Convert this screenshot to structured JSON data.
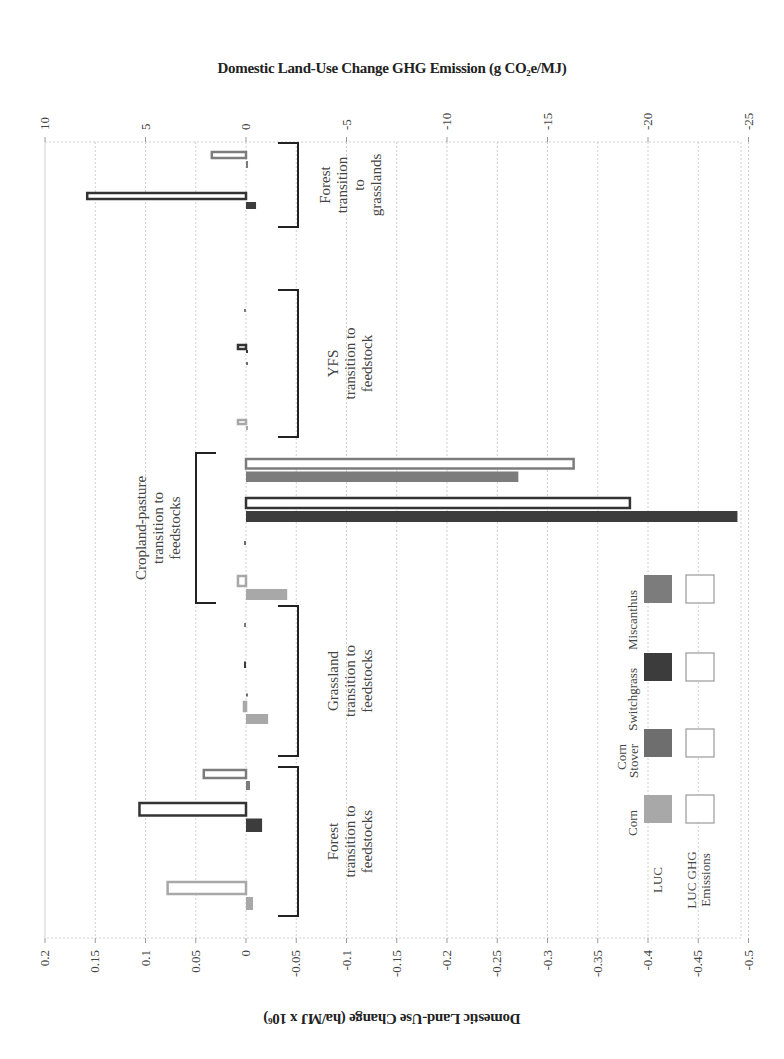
{
  "chart_data": {
    "type": "bar",
    "orientation": "horizontal-rotated",
    "title_top_axis": "Domestic Land-Use Change GHG  Emission (g CO2e/MJ)",
    "title_bottom_axis": "Domestic Land-Use Change (ha/MJ x 10^6)",
    "top_axis": {
      "label": "Domestic Land-Use Change GHG  Emission (g CO₂e/MJ)",
      "ticks": [
        10,
        5,
        0,
        -5,
        -10,
        -15,
        -20,
        -25
      ],
      "range": [
        10,
        -25
      ]
    },
    "bottom_axis": {
      "label": "Domestic Land-Use Change (ha/MJ x 10⁶)",
      "ticks": [
        0.2,
        0.15,
        0.1,
        0.05,
        0,
        -0.05,
        -0.1,
        -0.15,
        -0.2,
        -0.25,
        -0.3,
        -0.35,
        -0.4,
        -0.45,
        -0.5
      ],
      "range": [
        0.2,
        -0.5
      ]
    },
    "grid": true,
    "legend": {
      "position": "inside-bottom-right",
      "row_labels": [
        "LUC",
        "LUC GHG Emissions"
      ],
      "column_labels": [
        "Corn",
        "Corn Stover",
        "Switchgrass",
        "Miscanthus"
      ]
    },
    "colors": {
      "Corn": "#a8a8a8",
      "Corn Stover": "#6e6e6e",
      "Switchgrass": "#3c3c3c",
      "Miscanthus": "#7c7c7c"
    },
    "groups": [
      {
        "name": "Forest transition to grasslands",
        "label_lines": [
          "Forest",
          "transition",
          "to",
          "grasslands"
        ],
        "series": [
          {
            "feedstock": "Switchgrass",
            "luc": -0.01,
            "ghg": 7.9
          },
          {
            "feedstock": "Miscanthus",
            "luc": -0.002,
            "ghg": 1.7
          }
        ]
      },
      {
        "name": "YFS transition to feedstock",
        "label_lines": [
          "YFS",
          "transition to",
          "feedstock"
        ],
        "series": [
          {
            "feedstock": "Corn",
            "luc": 0.0,
            "ghg": 0.4
          },
          {
            "feedstock": "Corn Stover",
            "luc": 0.0,
            "ghg": 0.0
          },
          {
            "feedstock": "Switchgrass",
            "luc": 0.0,
            "ghg": 0.4
          },
          {
            "feedstock": "Miscanthus",
            "luc": 0.002,
            "ghg": 0.0
          }
        ]
      },
      {
        "name": "Cropland-pasture transition to feedstocks",
        "label_lines": [
          "Cropland-pasture",
          "transition to",
          "feedstocks"
        ],
        "series": [
          {
            "feedstock": "Corn",
            "luc": -0.041,
            "ghg": 0.4
          },
          {
            "feedstock": "Corn Stover",
            "luc": 0.002,
            "ghg": 0.0
          },
          {
            "feedstock": "Switchgrass",
            "luc": -0.489,
            "ghg": -19.1
          },
          {
            "feedstock": "Miscanthus",
            "luc": -0.271,
            "ghg": -16.3
          }
        ]
      },
      {
        "name": "Grassland transition to feedstocks",
        "label_lines": [
          "Grassland",
          "transition to",
          "feedstocks"
        ],
        "series": [
          {
            "feedstock": "Corn",
            "luc": -0.022,
            "ghg": 0.1
          },
          {
            "feedstock": "Corn Stover",
            "luc": 0.0,
            "ghg": 0.0
          },
          {
            "feedstock": "Switchgrass",
            "luc": 0.002,
            "ghg": 0.0
          },
          {
            "feedstock": "Miscanthus",
            "luc": 0.002,
            "ghg": 0.0
          }
        ]
      },
      {
        "name": "Forest transition to feedstocks",
        "label_lines": [
          "Forest",
          "transition to",
          "feedstocks"
        ],
        "series": [
          {
            "feedstock": "Corn",
            "luc": -0.007,
            "ghg": 3.9
          },
          {
            "feedstock": "Switchgrass",
            "luc": -0.016,
            "ghg": 5.3
          },
          {
            "feedstock": "Miscanthus",
            "luc": -0.004,
            "ghg": 2.1
          }
        ]
      }
    ]
  }
}
